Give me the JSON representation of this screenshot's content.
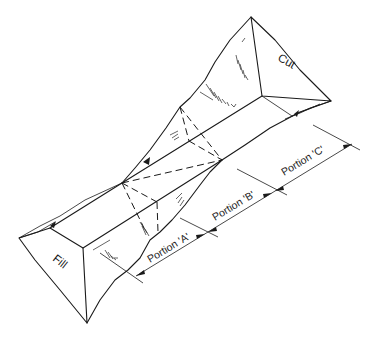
{
  "diagram": {
    "labels": {
      "cut": "Cut",
      "fill": "Fill",
      "portion_a": "Portion 'A'",
      "portion_b": "Portion 'B'",
      "portion_c": "Portion 'C'"
    },
    "colors": {
      "line": "#1a1a1a",
      "background": "#ffffff"
    }
  }
}
